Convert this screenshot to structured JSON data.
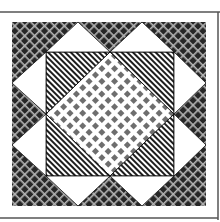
{
  "figure": {
    "width": 220,
    "height": 222,
    "colors": {
      "background": "#ffffff",
      "frame_line": "#555555",
      "crosshatch_bg": "#262626",
      "crosshatch_line": "#b4b4b4",
      "stripe_dark": "#1e1e1e",
      "stripe_light": "#ffffff",
      "checker_dot": "#6e6e6e",
      "checker_bg": "#ffffff",
      "white_triangle": "#ffffff",
      "outline": "#111111"
    },
    "regions": {
      "outer_border": "crosshatch",
      "inner_square_corners": "diagonal-stripes",
      "center_diamond": "checker",
      "flank_triangles": "white"
    }
  }
}
